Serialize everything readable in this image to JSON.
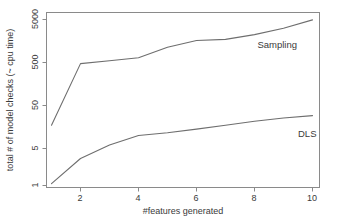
{
  "chart_data": {
    "type": "line",
    "title": "",
    "xlabel": "#features generated",
    "ylabel": "total # of model checks (~ cpu time)",
    "xlim": [
      0.6,
      10.4
    ],
    "ylim": [
      1,
      7000
    ],
    "yscale": "log",
    "xscale": "linear",
    "grid": false,
    "legend_position": "inline-right",
    "xticks": [
      2,
      4,
      6,
      8,
      10
    ],
    "xtick_labels": [
      "2",
      "4",
      "6",
      "8",
      "10"
    ],
    "yticks": [
      1,
      5,
      50,
      500,
      5000
    ],
    "ytick_labels": [
      "1",
      "5",
      "50",
      "500",
      "5000"
    ],
    "x": [
      1,
      2,
      3,
      4,
      5,
      6,
      7,
      8,
      9,
      10
    ],
    "series": [
      {
        "name": "Sampling",
        "label": "Sampling",
        "color": "#6e6e6e",
        "values": [
          22,
          520,
          600,
          700,
          1200,
          1700,
          1800,
          2300,
          3200,
          4900
        ]
      },
      {
        "name": "DLS",
        "label": "DLS",
        "color": "#6e6e6e",
        "values": [
          1.1,
          4.0,
          8.0,
          13.0,
          15.0,
          18.0,
          22.0,
          27.0,
          32.0,
          36.0
        ]
      }
    ],
    "annotations": [
      {
        "text": "Sampling",
        "x": 8.1,
        "y": 1150
      },
      {
        "text": "DLS",
        "x": 9.5,
        "y": 12
      }
    ]
  },
  "axes": {
    "x_axis_title": "#features generated",
    "y_axis_title": "total # of model checks (~ cpu time)"
  }
}
